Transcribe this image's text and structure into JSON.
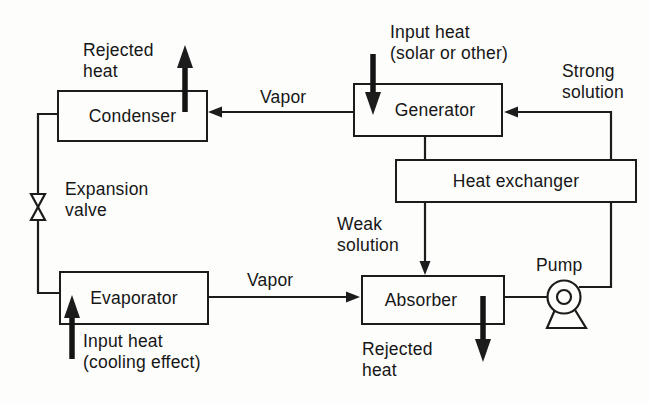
{
  "diagram_type": "process-flow-diagram",
  "colors": {
    "background": "#fdfdfc",
    "line": "#1c1c1c",
    "text": "#161616"
  },
  "nodes": {
    "condenser": {
      "label": "Condenser"
    },
    "generator": {
      "label": "Generator"
    },
    "heat_exchanger": {
      "label": "Heat exchanger"
    },
    "evaporator": {
      "label": "Evaporator"
    },
    "absorber": {
      "label": "Absorber"
    }
  },
  "labels": {
    "rejected_heat_top": {
      "line1": "Rejected",
      "line2": "heat"
    },
    "input_heat_solar": {
      "line1": "Input heat",
      "line2": "(solar or other)"
    },
    "strong_solution": {
      "line1": "Strong",
      "line2": "solution"
    },
    "vapor_top": {
      "text": "Vapor"
    },
    "expansion_valve": {
      "line1": "Expansion",
      "line2": "valve"
    },
    "weak_solution": {
      "line1": "Weak",
      "line2": "solution"
    },
    "pump": {
      "text": "Pump"
    },
    "vapor_bottom": {
      "text": "Vapor"
    },
    "input_heat_cooling": {
      "line1": "Input heat",
      "line2": "(cooling effect)"
    },
    "rejected_heat_bottom": {
      "line1": "Rejected",
      "line2": "heat"
    }
  },
  "edges": [
    {
      "from": "generator",
      "to": "condenser",
      "label": "Vapor"
    },
    {
      "from": "condenser",
      "to": "evaporator",
      "via": "expansion valve"
    },
    {
      "from": "evaporator",
      "to": "absorber",
      "label": "Vapor"
    },
    {
      "from": "absorber",
      "to": "pump"
    },
    {
      "from": "pump",
      "to": "generator",
      "label": "Strong solution",
      "via": "heat exchanger"
    },
    {
      "from": "generator",
      "to": "absorber",
      "label": "Weak solution",
      "via": "heat exchanger"
    }
  ]
}
